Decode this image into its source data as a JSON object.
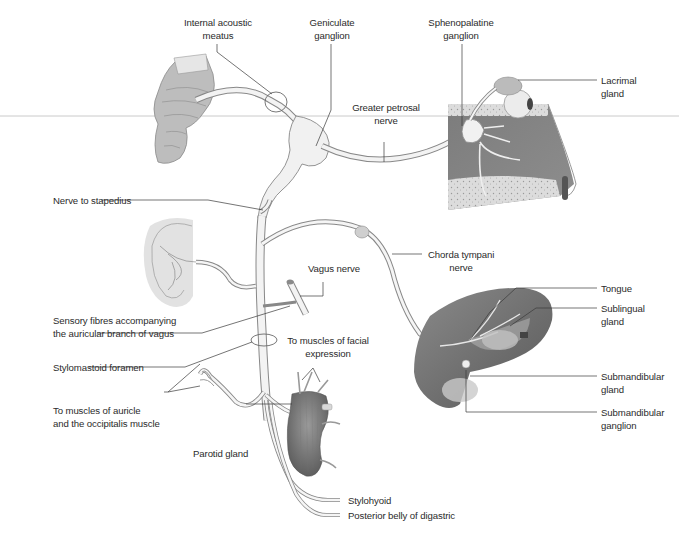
{
  "figure": {
    "background": "#ffffff",
    "colors": {
      "nerve_fill": "#f1f1f1",
      "nerve_stroke": "#7a7a7a",
      "leader_line": "#3a3a3a",
      "tissue_dark": "#6f6f6f",
      "tissue_mid": "#9a9a9a",
      "tissue_light": "#d6d6d6",
      "text": "#2b2b2b"
    }
  },
  "labels": {
    "internal_acoustic_meatus": [
      "Internal acoustic",
      "meatus"
    ],
    "geniculate_ganglion": [
      "Geniculate",
      "ganglion"
    ],
    "sphenopalatine_ganglion": [
      "Sphenopalatine",
      "ganglion"
    ],
    "lacrimal_gland": [
      "Lacrimal",
      "gland"
    ],
    "greater_petrosal_nerve": [
      "Greater petrosal",
      "nerve"
    ],
    "nerve_to_stapedius": [
      "Nerve to stapedius"
    ],
    "chorda_tympani_nerve": [
      "Chorda tympani",
      "nerve"
    ],
    "vagus_nerve": [
      "Vagus nerve"
    ],
    "tongue": [
      "Tongue"
    ],
    "sensory_fibres": [
      "Sensory fibres accompanying",
      "the auricular branch of vagus"
    ],
    "sublingual_gland": [
      "Sublingual",
      "gland"
    ],
    "stylomastoid_foramen": [
      "Stylomastoid foramen"
    ],
    "muscles_facial_expression": [
      "To muscles of facial",
      "expression"
    ],
    "submandibular_gland": [
      "Submandibular",
      "gland"
    ],
    "muscles_auricle": [
      "To muscles of auricle",
      "and the occipitalis muscle"
    ],
    "submandibular_ganglion": [
      "Submandibular",
      "ganglion"
    ],
    "parotid_gland": [
      "Parotid gland"
    ],
    "stylohyoid": [
      "Stylohyoid"
    ],
    "posterior_belly_digastric": [
      "Posterior belly of digastric"
    ]
  }
}
